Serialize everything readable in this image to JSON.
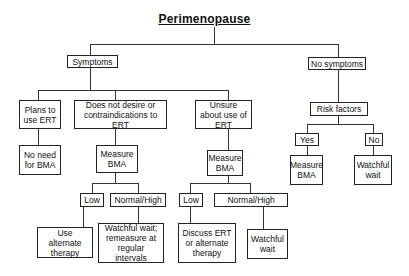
{
  "title": "Perimenopause",
  "nodes": {
    "symptoms": "Symptoms",
    "no_symptoms": "No symptoms",
    "plans_ert": "Plans to use ERT",
    "no_desire_ert": "Does not desire or contraindications to ERT",
    "unsure_ert": "Unsure about use of ERT",
    "risk_factors": "Risk factors",
    "no_need_bma": "No need for BMA",
    "measure_bma_1": "Measure BMA",
    "measure_bma_2": "Measure BMA",
    "yes": "Yes",
    "no": "No",
    "measure_bma_3": "Measure BMA",
    "watchful_wait_1": "Watchful wait",
    "low_1": "Low",
    "normal_high_1": "Normal/High",
    "use_alternate": "Use alternate therapy",
    "watchful_remeasure": "Watchful wait; remeasure at regular intervals",
    "low_2": "Low",
    "normal_high_2": "Normal/High",
    "discuss_ert": "Discuss ERT or alternate therapy",
    "watchful_wait_2": "Watchful wait"
  }
}
